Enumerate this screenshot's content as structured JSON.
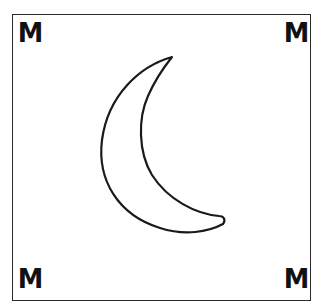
{
  "card": {
    "corners": {
      "top_left": "M",
      "top_right": "M",
      "bottom_left": "M",
      "bottom_right": "M"
    },
    "symbol": "crescent-moon",
    "colors": {
      "stroke": "#1a1a1a",
      "background": "#ffffff"
    }
  }
}
